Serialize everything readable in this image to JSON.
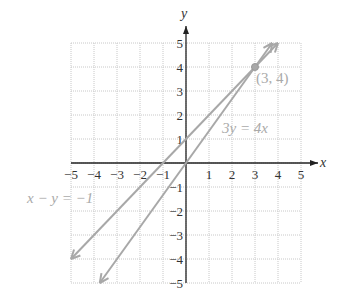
{
  "chart_data": {
    "type": "line",
    "title": "",
    "xlabel": "x",
    "ylabel": "y",
    "xlim": [
      -5,
      5
    ],
    "ylim": [
      -5,
      5
    ],
    "grid": true,
    "x_ticks": [
      "−5",
      "−4",
      "−3",
      "−2",
      "−1",
      "1",
      "2",
      "3",
      "4",
      "5"
    ],
    "y_ticks": [
      "5",
      "4",
      "3",
      "2",
      "1",
      "−1",
      "−2",
      "−3",
      "−4",
      "−5"
    ],
    "series": [
      {
        "name": "3y = 4x",
        "equation": "3y = 4x",
        "points": [
          [
            -3.75,
            -5
          ],
          [
            3.75,
            5
          ]
        ]
      },
      {
        "name": "x − y = −1",
        "equation": "x − y = −1",
        "points": [
          [
            -5,
            -4
          ],
          [
            4,
            5
          ]
        ]
      }
    ],
    "annotations": [
      {
        "text": "(3, 4)",
        "x": 3,
        "y": 4,
        "type": "intersection-point"
      },
      {
        "text": "3y = 4x"
      },
      {
        "text": "x − y = −1"
      }
    ],
    "colors": {
      "lines": "#a8a8a8",
      "grid": "#c8c8c8",
      "axes": "#222222",
      "point": "#a8a8a8"
    }
  }
}
